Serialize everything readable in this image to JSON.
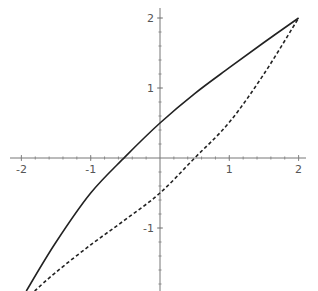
{
  "chart_data": {
    "type": "line",
    "title": "",
    "xlabel": "",
    "ylabel": "",
    "xlim": [
      -2.1,
      2.2
    ],
    "ylim": [
      -1.9,
      2.15
    ],
    "grid": false,
    "legend": null,
    "axes_origin": [
      0,
      0
    ],
    "x_ticks": [
      -2,
      -1,
      1,
      2
    ],
    "x_tick_labels": [
      "-2",
      "-1",
      "1",
      "2"
    ],
    "y_ticks": [
      -1,
      1,
      2
    ],
    "y_tick_labels": [
      "-1",
      "1",
      "2"
    ],
    "series": [
      {
        "name": "solid curve",
        "style": "solid",
        "color": "#222222",
        "x": [
          -1.93,
          -1.5,
          -1.0,
          -0.5,
          0.0,
          0.5,
          1.0,
          1.5,
          2.0
        ],
        "y": [
          -1.9,
          -1.2,
          -0.5,
          0.02,
          0.5,
          0.92,
          1.29,
          1.65,
          2.0
        ]
      },
      {
        "name": "dashed curve",
        "style": "dashed",
        "color": "#222222",
        "x": [
          -1.81,
          -1.5,
          -1.0,
          -0.5,
          0.0,
          0.5,
          1.0,
          1.5,
          2.0
        ],
        "y": [
          -1.9,
          -1.63,
          -1.24,
          -0.88,
          -0.5,
          0.0,
          0.51,
          1.2,
          2.0
        ]
      }
    ]
  }
}
